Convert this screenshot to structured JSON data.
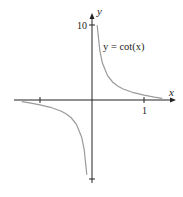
{
  "chart_data": {
    "type": "line",
    "title": "",
    "function_label": "y = cot(x)",
    "xlabel": "x",
    "ylabel": "y",
    "x_tick_labels": [
      "1"
    ],
    "y_tick_labels": [
      "10"
    ],
    "x_ticks": [
      -1,
      1
    ],
    "y_ticks": [
      -10,
      10
    ],
    "xlim": [
      -1.4,
      1.6
    ],
    "ylim": [
      -10.5,
      10.5
    ],
    "grid": false,
    "legend": "none",
    "series": [
      {
        "name": "cot(x), x > 0",
        "x": [
          0.1,
          0.15,
          0.2,
          0.3,
          0.4,
          0.5,
          0.6,
          0.8,
          1.0,
          1.2,
          1.35
        ],
        "y": [
          9.97,
          6.62,
          4.93,
          3.24,
          2.37,
          1.83,
          1.46,
          0.97,
          0.64,
          0.39,
          0.22
        ]
      },
      {
        "name": "cot(x), x < 0",
        "x": [
          -1.35,
          -1.2,
          -1.0,
          -0.8,
          -0.6,
          -0.5,
          -0.4,
          -0.3,
          -0.2,
          -0.15,
          -0.1
        ],
        "y": [
          -0.22,
          -0.39,
          -0.64,
          -0.97,
          -1.46,
          -1.83,
          -2.37,
          -3.24,
          -4.93,
          -6.62,
          -9.97
        ]
      }
    ],
    "colors": {
      "curve": "#9a9a9a",
      "axes": "#222222"
    }
  }
}
